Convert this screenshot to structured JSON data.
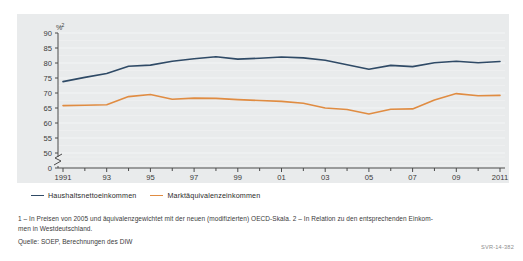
{
  "chart_data": {
    "type": "line",
    "title": "",
    "xlabel": "",
    "ylabel": "%",
    "ylabel_superscript": "2",
    "ylim": [
      50,
      90
    ],
    "yticks": [
      50,
      55,
      60,
      65,
      70,
      75,
      80,
      85,
      90
    ],
    "ytick_labels": [
      "50",
      "55",
      "60",
      "65",
      "70",
      "75",
      "80",
      "85",
      "90"
    ],
    "zero_tick_label": "0",
    "axis_break": true,
    "grid": true,
    "legend_position": "below-left",
    "x": [
      1991,
      1992,
      1993,
      1994,
      1995,
      1996,
      1997,
      1998,
      1999,
      2000,
      2001,
      2002,
      2003,
      2004,
      2005,
      2006,
      2007,
      2008,
      2009,
      2010,
      2011
    ],
    "xtick_labels": [
      "1991",
      "93",
      "95",
      "97",
      "99",
      "01",
      "03",
      "05",
      "07",
      "09",
      "2011"
    ],
    "xtick_years": [
      1991,
      1993,
      1995,
      1997,
      1999,
      2001,
      2003,
      2005,
      2007,
      2009,
      2011
    ],
    "series": [
      {
        "name": "Haushaltsnettoeinkommen",
        "color": "#2f4a66",
        "values": [
          73.8,
          75.2,
          76.5,
          78.9,
          79.3,
          80.6,
          81.4,
          82.1,
          81.3,
          81.6,
          82.0,
          81.7,
          80.9,
          79.4,
          77.9,
          79.2,
          78.8,
          80.1,
          80.6,
          80.1,
          80.5
        ]
      },
      {
        "name": "Marktäquivalenzeinkommen",
        "color": "#e08c42",
        "values": [
          65.8,
          65.9,
          66.1,
          68.8,
          69.5,
          67.9,
          68.3,
          68.2,
          67.8,
          67.5,
          67.2,
          66.6,
          65.0,
          64.5,
          63.0,
          64.6,
          64.7,
          67.7,
          69.8,
          69.1,
          69.2
        ]
      }
    ]
  },
  "footnotes": {
    "line1": "1 – In Preisen von 2005 und äquivalenzgewichtet mit der neuen (modifizierten) OECD-Skala.  2 – In Relation zu den entsprechenden Einkom-",
    "line2": "men in Westdeutschland."
  },
  "source": "Quelle: SOEP, Berechnungen des DIW",
  "reference_code": "SVR-14-382",
  "colors": {
    "panel_background": "#e9ebec",
    "gridline": "#f4f5f6",
    "axis": "#4a4a4a",
    "series_1": "#2f4a66",
    "series_2": "#e08c42"
  }
}
